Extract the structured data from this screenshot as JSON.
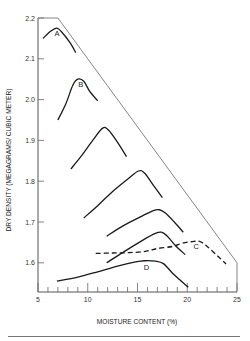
{
  "chart_data": {
    "type": "line",
    "title": "",
    "xlabel": "MOISTURE CONTENT (%)",
    "ylabel": "DRY DENSITY (MEGAGRAMS/ CUBIC METER)",
    "xlim": [
      5,
      25
    ],
    "ylim": [
      1.53,
      2.2
    ],
    "x_ticks": [
      5,
      10,
      15,
      20,
      25
    ],
    "x_minor_step": 1,
    "y_ticks": [
      1.6,
      1.7,
      1.8,
      1.9,
      2.0,
      2.1,
      2.2
    ],
    "grid": false,
    "legend": "none (curves labeled inline)",
    "boundary_line": {
      "name": "zero-air-voids envelope",
      "points": [
        [
          5,
          2.2
        ],
        [
          7,
          2.2
        ],
        [
          25,
          1.6
        ],
        [
          25,
          1.53
        ]
      ]
    },
    "series": [
      {
        "name": "A",
        "style": "solid",
        "label": "A",
        "label_pos": [
          6.9,
          2.155
        ],
        "points": [
          [
            5.5,
            2.15
          ],
          [
            6.3,
            2.168
          ],
          [
            6.9,
            2.175
          ],
          [
            7.4,
            2.165
          ],
          [
            8.2,
            2.14
          ],
          [
            8.8,
            2.115
          ]
        ]
      },
      {
        "name": "B",
        "style": "solid",
        "label": "B",
        "label_pos": [
          9.3,
          2.032
        ],
        "points": [
          [
            7.0,
            1.95
          ],
          [
            7.8,
            1.99
          ],
          [
            8.5,
            2.035
          ],
          [
            9.0,
            2.05
          ],
          [
            9.6,
            2.045
          ],
          [
            10.2,
            2.02
          ],
          [
            11.0,
            1.997
          ]
        ]
      },
      {
        "name": "curve-3",
        "style": "solid",
        "label": "",
        "points": [
          [
            8.3,
            1.83
          ],
          [
            9.3,
            1.86
          ],
          [
            10.5,
            1.9
          ],
          [
            11.5,
            1.93
          ],
          [
            12.1,
            1.925
          ],
          [
            13.0,
            1.895
          ],
          [
            13.9,
            1.86
          ]
        ]
      },
      {
        "name": "curve-4",
        "style": "solid",
        "label": "",
        "points": [
          [
            9.6,
            1.71
          ],
          [
            11.0,
            1.74
          ],
          [
            12.5,
            1.775
          ],
          [
            14.0,
            1.805
          ],
          [
            15.1,
            1.825
          ],
          [
            15.7,
            1.82
          ],
          [
            16.6,
            1.79
          ],
          [
            17.5,
            1.76
          ]
        ]
      },
      {
        "name": "curve-5",
        "style": "solid",
        "label": "",
        "points": [
          [
            11.9,
            1.665
          ],
          [
            13.5,
            1.69
          ],
          [
            15.5,
            1.715
          ],
          [
            16.6,
            1.728
          ],
          [
            17.2,
            1.73
          ],
          [
            17.8,
            1.722
          ],
          [
            18.7,
            1.7
          ],
          [
            19.6,
            1.675
          ]
        ]
      },
      {
        "name": "curve-6",
        "style": "solid",
        "label": "",
        "points": [
          [
            11.9,
            1.6
          ],
          [
            13.5,
            1.625
          ],
          [
            15.5,
            1.655
          ],
          [
            16.8,
            1.672
          ],
          [
            17.4,
            1.675
          ],
          [
            18.0,
            1.665
          ],
          [
            18.9,
            1.64
          ],
          [
            19.8,
            1.62
          ]
        ]
      },
      {
        "name": "C",
        "style": "dashed",
        "label": "C",
        "label_pos": [
          20.9,
          1.635
        ],
        "points": [
          [
            10.8,
            1.623
          ],
          [
            12.5,
            1.624
          ],
          [
            14.2,
            1.625
          ],
          [
            15.8,
            1.628
          ],
          [
            17.0,
            1.635
          ],
          [
            18.5,
            1.64
          ],
          [
            19.5,
            1.648
          ],
          [
            20.5,
            1.652
          ],
          [
            21.3,
            1.652
          ],
          [
            22.0,
            1.64
          ],
          [
            23.0,
            1.618
          ],
          [
            23.9,
            1.597
          ]
        ]
      },
      {
        "name": "D",
        "style": "solid",
        "label": "D",
        "label_pos": [
          15.9,
          1.583
        ],
        "points": [
          [
            6.9,
            1.555
          ],
          [
            9.0,
            1.565
          ],
          [
            11.0,
            1.578
          ],
          [
            13.0,
            1.592
          ],
          [
            14.8,
            1.602
          ],
          [
            15.7,
            1.605
          ],
          [
            16.8,
            1.604
          ],
          [
            17.6,
            1.598
          ],
          [
            18.5,
            1.575
          ],
          [
            19.3,
            1.557
          ],
          [
            20.1,
            1.54
          ]
        ]
      }
    ]
  },
  "axes": {
    "x_title": "MOISTURE CONTENT (%)",
    "y_title": "DRY DENSITY (MEGAGRAMS/ CUBIC METER)"
  }
}
